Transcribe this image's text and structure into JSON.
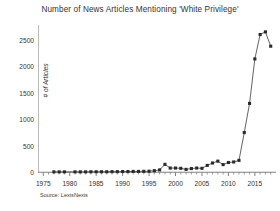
{
  "chart_data": {
    "type": "line",
    "title": "Number of News Articles Mentioning 'White Privilege'",
    "xlabel": "",
    "ylabel": "# of Articles",
    "source": "Source: LexisNexis",
    "xlim": [
      1974,
      2019
    ],
    "ylim": [
      -70,
      2780
    ],
    "grid": false,
    "legend": "none",
    "marker": "filled-square",
    "line_color": "#3b3b3b",
    "marker_color": "#2a2a2a",
    "axis_color": "#808080",
    "xticks": [
      1975,
      1980,
      1985,
      1990,
      1995,
      2000,
      2005,
      2010,
      2015
    ],
    "yticks": [
      0,
      500,
      1000,
      1500,
      2000,
      2500
    ],
    "x": [
      1977,
      1978,
      1979,
      1981,
      1982,
      1983,
      1984,
      1985,
      1986,
      1987,
      1988,
      1989,
      1990,
      1991,
      1992,
      1993,
      1994,
      1995,
      1996,
      1997,
      1998,
      1999,
      2000,
      2001,
      2002,
      2003,
      2004,
      2005,
      2006,
      2007,
      2008,
      2009,
      2010,
      2011,
      2012,
      2013,
      2014,
      2015,
      2016,
      2017,
      2018
    ],
    "values": [
      8,
      8,
      8,
      8,
      8,
      8,
      10,
      10,
      10,
      10,
      12,
      12,
      14,
      14,
      16,
      16,
      18,
      20,
      30,
      45,
      150,
      80,
      80,
      75,
      55,
      70,
      80,
      75,
      130,
      175,
      210,
      145,
      185,
      195,
      225,
      750,
      1300,
      2140,
      2600,
      2650,
      2380
    ]
  }
}
